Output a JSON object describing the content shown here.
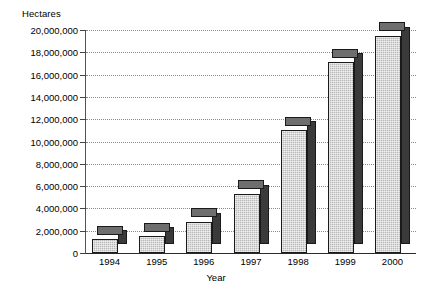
{
  "chart_data": {
    "type": "bar",
    "title": "",
    "subtitle": "",
    "ylabel": "Hectares",
    "xlabel": "Year",
    "categories": [
      "1994",
      "1995",
      "1996",
      "1997",
      "1998",
      "1999",
      "2000"
    ],
    "values": [
      1250000,
      1500000,
      2800000,
      5300000,
      11000000,
      17100000,
      19500000
    ],
    "ylim": [
      0,
      20000000
    ],
    "ytick_values": [
      0,
      2000000,
      4000000,
      6000000,
      8000000,
      10000000,
      12000000,
      14000000,
      16000000,
      18000000,
      20000000
    ],
    "ytick_labels": [
      "0",
      "2,000,000",
      "4,000,000",
      "6,000,000",
      "8,000,000",
      "10,000,000",
      "12,000,000",
      "14,000,000",
      "16,000,000",
      "18,000,000",
      "20,000,000"
    ],
    "grid": true,
    "grid_style": "dotted-horizontal",
    "legend": "none",
    "style": "3d-columns",
    "series": [
      {
        "name": "Hectares",
        "values": [
          1250000,
          1500000,
          2800000,
          5300000,
          11000000,
          17100000,
          19500000
        ]
      }
    ],
    "colors": {
      "bar_front": "#b9b9b9",
      "bar_side": "#3a3a3a",
      "bar_top": "#6e6e6e",
      "bar_outline": "#1a1a1a",
      "gridline": "#8a8a8a",
      "axis": "#2b2b2b",
      "background": "#ffffff",
      "text": "#000000"
    }
  }
}
